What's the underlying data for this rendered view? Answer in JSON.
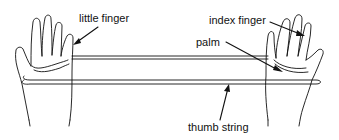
{
  "diagram": {
    "type": "string-figure",
    "labels": {
      "little_finger": "little finger",
      "index_finger": "index finger",
      "palm": "palm",
      "thumb_string": "thumb string"
    },
    "colors": {
      "ink": "#111111",
      "background": "#ffffff"
    }
  }
}
